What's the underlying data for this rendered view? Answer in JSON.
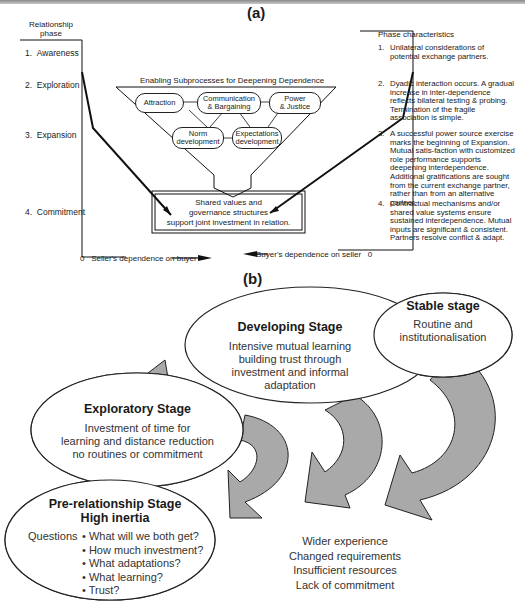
{
  "panel_a": {
    "label": "(a)",
    "left_header": [
      "Relationship",
      "phase"
    ],
    "right_header": "Phase characteristics",
    "phases": [
      {
        "num": "1.",
        "name": "Awareness"
      },
      {
        "num": "2.",
        "name": "Exploration"
      },
      {
        "num": "3.",
        "name": "Expansion"
      },
      {
        "num": "4.",
        "name": "Commitment"
      }
    ],
    "subprocesses_title": "Enabling Subprocesses for Deepening Dependence",
    "subprocesses": [
      {
        "line1": "Attraction",
        "line2": ""
      },
      {
        "line1": "Communication",
        "line2": "& Bargaining"
      },
      {
        "line1": "Power",
        "line2": "& Justice"
      },
      {
        "line1": "Norm",
        "line2": "development"
      },
      {
        "line1": "Expectations",
        "line2": "development"
      }
    ],
    "shared_box": [
      "Shared values and",
      "governance structures",
      "support joint investment in relation."
    ],
    "x_axis_left": {
      "zero": "0",
      "label": "Seller's dependence on buyer"
    },
    "x_axis_right": {
      "zero": "0",
      "label": "Buyer's dependence on seller"
    },
    "characteristics": [
      {
        "num": "1.",
        "text": "Unilateral considerations of potential exchange partners."
      },
      {
        "num": "2.",
        "text": "Dyadic interaction occurs. A gradual increase in inter-dependence reflects bilateral testing & probing. Termination of the fragile association is simple."
      },
      {
        "num": "3.",
        "text": "A successful power source exercise marks the beginning of Expansion. Mutual satis-faction with customized role performance supports deepening interdependence. Additional gratifications are sought from the current exchange partner, rather than from an alternative partner."
      },
      {
        "num": "4.",
        "text": "Contractual mechanisms and/or shared value systems ensure sustained interdependence. Mutual inputs are significant & consistent. Partners resolve conflict & adapt."
      }
    ]
  },
  "panel_b": {
    "label": "(b)",
    "stages": [
      {
        "title": "Stable stage",
        "body": [
          "Routine and",
          "institutionalisation"
        ]
      },
      {
        "title": "Developing Stage",
        "body": [
          "Intensive mutual learning",
          "building trust through",
          "investment and informal",
          "adaptation"
        ]
      },
      {
        "title": "Exploratory Stage",
        "body": [
          "Investment of time for",
          "learning and distance reduction",
          "no routines or commitment"
        ]
      },
      {
        "title": "Pre-relationship Stage",
        "subtitle": "High inertia",
        "questions_label": "Questions",
        "questions": [
          "What will we both get?",
          "How much investment?",
          "What adaptations?",
          "What learning?",
          "Trust?"
        ]
      }
    ],
    "exit_reasons": [
      "Wider experience",
      "Changed requirements",
      "Insufficient resources",
      "Lack of commitment"
    ],
    "colors": {
      "arrow_fill": "#a9a9a9",
      "outline": "#222222",
      "background": "#ffffff"
    }
  }
}
